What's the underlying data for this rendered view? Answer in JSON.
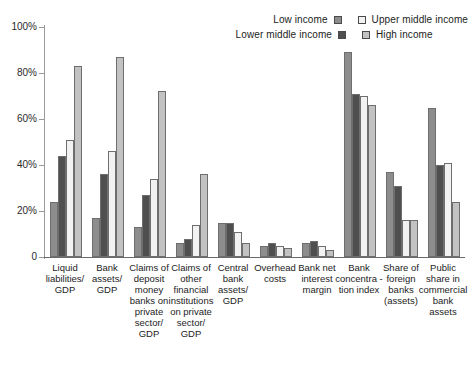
{
  "legend": {
    "entries": [
      {
        "label": "Low income",
        "swatch": "low-income-swatch",
        "color": "#8d8d8d"
      },
      {
        "label": "Upper middle income",
        "swatch": "upper-middle-income-swatch",
        "color": "#f2f2f2"
      },
      {
        "label": "Lower middle income",
        "swatch": "lower-middle-income-swatch",
        "color": "#4f4f4f"
      },
      {
        "label": "High income",
        "swatch": "high-income-swatch",
        "color": "#c2c2c2"
      }
    ]
  },
  "axis": {
    "y_ticks": [
      "100%",
      "80%",
      "60%",
      "40%",
      "20%",
      "0"
    ]
  },
  "chart_data": {
    "type": "bar",
    "title": "",
    "xlabel": "",
    "ylabel": "",
    "ylim": [
      0,
      100
    ],
    "ytick_values": [
      0,
      20,
      40,
      60,
      80,
      100
    ],
    "grid": false,
    "legend_position": "top-right",
    "categories": [
      "Liquid liabilities/ GDP",
      "Bank assets/ GDP",
      "Claims of deposit money banks on private sector/ GDP",
      "Claims of other financial institutions on private sector/ GDP",
      "Central bank assets/ GDP",
      "Overhead costs",
      "Bank net interest margin",
      "Bank concentra -tion index",
      "Share of foreign banks (assets)",
      "Public share in commercial bank assets"
    ],
    "series": [
      {
        "name": "Low income",
        "color": "#8d8d8d",
        "values": [
          24,
          17,
          13,
          6,
          15,
          5,
          6,
          89,
          37,
          65
        ]
      },
      {
        "name": "Lower middle income",
        "color": "#4f4f4f",
        "values": [
          44,
          36,
          27,
          8,
          15,
          6,
          7,
          71,
          31,
          40
        ]
      },
      {
        "name": "Upper middle income",
        "color": "#f2f2f2",
        "values": [
          51,
          46,
          34,
          14,
          11,
          5,
          5,
          70,
          16,
          41
        ]
      },
      {
        "name": "High income",
        "color": "#c2c2c2",
        "values": [
          83,
          87,
          72,
          36,
          6,
          4,
          3,
          66,
          16,
          24
        ]
      }
    ]
  }
}
